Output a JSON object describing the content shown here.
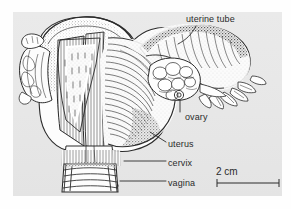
{
  "figure": {
    "type": "anatomical-illustration",
    "style": "pen-and-ink engraving, monochrome",
    "background_color": "#e9e9e9",
    "ink_color": "#2b2b2b"
  },
  "labels": {
    "uterine_tube": "uterine tube",
    "ovary": "ovary",
    "uterus": "uterus",
    "cervix": "cervix",
    "vagina": "vagina"
  },
  "scale_bar": {
    "text": "2 cm",
    "length_px": 62,
    "tick_style": "end-caps"
  }
}
